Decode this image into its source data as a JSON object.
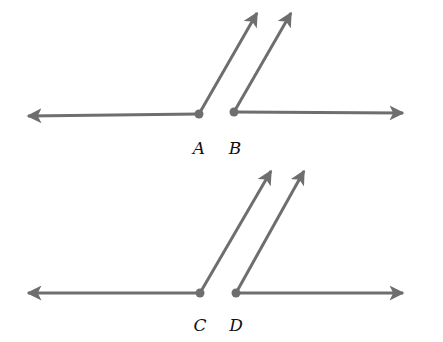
{
  "style": {
    "stroke": "#6e6e6e",
    "stroke_width": 3,
    "vertex_radius": 4.5,
    "label_color": "#111111"
  },
  "angles": [
    {
      "name": "A",
      "label": "A",
      "vertex": [
        199,
        114
      ],
      "ray_ends": [
        [
          28,
          116
        ],
        [
          257,
          13
        ]
      ],
      "label_pos": [
        199,
        148
      ]
    },
    {
      "name": "B",
      "label": "B",
      "vertex": [
        234,
        112
      ],
      "ray_ends": [
        [
          291,
          13
        ],
        [
          403,
          113
        ]
      ],
      "label_pos": [
        235,
        148
      ]
    },
    {
      "name": "C",
      "label": "C",
      "vertex": [
        200,
        293
      ],
      "ray_ends": [
        [
          28,
          293
        ],
        [
          271,
          171
        ]
      ],
      "label_pos": [
        200,
        325
      ]
    },
    {
      "name": "D",
      "label": "D",
      "vertex": [
        236,
        293
      ],
      "ray_ends": [
        [
          304,
          171
        ],
        [
          403,
          293
        ]
      ],
      "label_pos": [
        236,
        325
      ]
    }
  ]
}
